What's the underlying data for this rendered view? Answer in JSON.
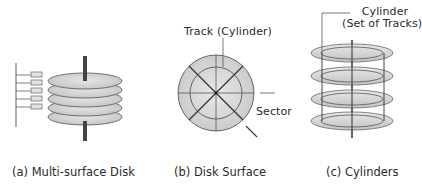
{
  "figure": {
    "panels": [
      {
        "id": "a",
        "caption": "(a) Multi-surface Disk",
        "platter_count": 5,
        "head_count": 5
      },
      {
        "id": "b",
        "caption": "(b) Disk Surface",
        "labels": {
          "track": "Track (Cylinder)",
          "sector": "Sector"
        }
      },
      {
        "id": "c",
        "caption": "(c) Cylinders",
        "labels": {
          "cylinder_line1": "Cylinder",
          "cylinder_line2": "(Set of Tracks)"
        },
        "track_count": 4
      }
    ],
    "colors": {
      "platter_fill": "#d6d6d6",
      "platter_stroke": "#555555",
      "spindle": "#444444",
      "line": "#333333",
      "head_fill": "#e2e2e2"
    }
  }
}
